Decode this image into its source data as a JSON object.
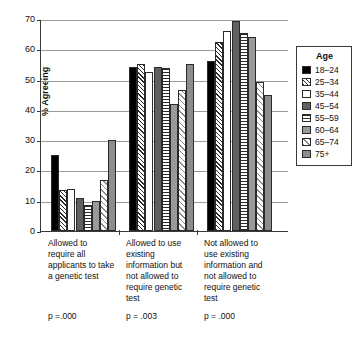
{
  "chart_data": {
    "type": "bar",
    "title": "",
    "xlabel": "",
    "ylabel": "% Agreeing",
    "ylim": [
      0,
      70
    ],
    "ytick_labels": [
      "0",
      "10",
      "20",
      "30",
      "40",
      "50",
      "60",
      "70"
    ],
    "yticks": [
      0,
      10,
      20,
      30,
      40,
      50,
      60,
      70
    ],
    "grid": true,
    "legend_position": "right",
    "legend_title": "Age",
    "categories": [
      "Allowed to require all applicants to take a genetic test",
      "Allowed to use existing information but not allowed to require genetic test",
      "Not allowed to use existing information and not allowed to require genetic test"
    ],
    "category_lines": [
      [
        "Allowed to",
        "require all",
        "applicants to take",
        "a genetic test"
      ],
      [
        "Allowed to use",
        "existing",
        "information but",
        "not allowed to",
        "require genetic",
        "test"
      ],
      [
        "Not allowed to",
        "use existing",
        "information and",
        "not allowed to",
        "require genetic",
        "test"
      ]
    ],
    "annotations": [
      "p =.000",
      "p = .003",
      "p = .000"
    ],
    "series": [
      {
        "name": "18–24",
        "pattern": "solid-black",
        "values": [
          25.0,
          54.0,
          56.0
        ]
      },
      {
        "name": "25–34",
        "pattern": "diagonal-hatch",
        "values": [
          13.5,
          55.0,
          62.5
        ]
      },
      {
        "name": "35–44",
        "pattern": "white",
        "values": [
          14.0,
          52.5,
          66.0
        ]
      },
      {
        "name": "45–54",
        "pattern": "dark-gray",
        "values": [
          11.0,
          54.3,
          69.5
        ]
      },
      {
        "name": "55–59",
        "pattern": "horizontal-lines",
        "values": [
          8.5,
          53.7,
          65.5
        ]
      },
      {
        "name": "60–64",
        "pattern": "medium-gray",
        "values": [
          10.0,
          42.0,
          64.0
        ]
      },
      {
        "name": "65–74",
        "pattern": "light-crosshatch",
        "values": [
          17.0,
          46.7,
          49.3
        ]
      },
      {
        "name": "75+",
        "pattern": "gray",
        "values": [
          30.0,
          55.0,
          45.0
        ]
      }
    ]
  }
}
